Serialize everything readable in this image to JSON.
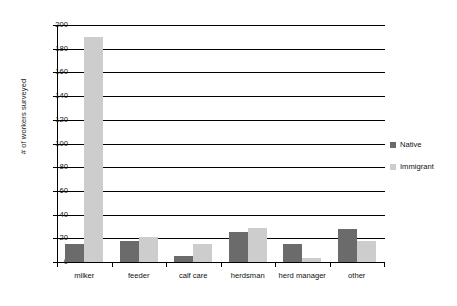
{
  "chart_data": {
    "type": "bar",
    "title": "",
    "xlabel": "",
    "ylabel": "# of workers surveyed",
    "categories": [
      "milker",
      "feeder",
      "calf care",
      "herdsman",
      "herd manager",
      "other"
    ],
    "series": [
      {
        "name": "Native",
        "color": "#6b6b6b",
        "values": [
          15,
          18,
          5,
          25,
          15,
          28
        ]
      },
      {
        "name": "Immigrant",
        "color": "#cdcdcd",
        "values": [
          190,
          21,
          15,
          29,
          3,
          18
        ]
      }
    ],
    "ylim": [
      0,
      200
    ],
    "yticks": [
      200,
      180,
      160,
      140,
      120,
      100,
      80,
      60,
      40,
      20,
      0
    ],
    "ytick_labels": [
      "200",
      "180",
      "160",
      "140",
      "120",
      "100",
      "80",
      "60",
      "40",
      "20",
      "0"
    ],
    "grid": true,
    "legend_position": "right"
  },
  "legend": {
    "entries": [
      {
        "label": "Native"
      },
      {
        "label": "Immigrant"
      }
    ]
  }
}
